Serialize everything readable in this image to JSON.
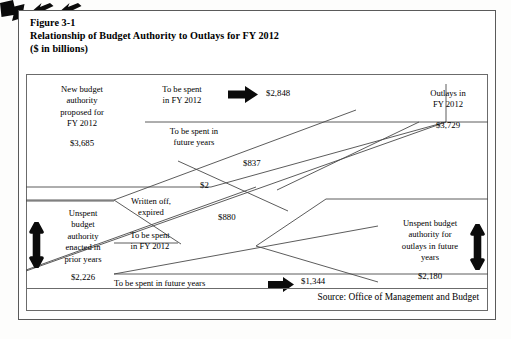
{
  "caption": {
    "line1": "Figure 3-1",
    "line2": "Relationship of Budget Authority to Outlays for FY 2012",
    "line3": "($ in billions)"
  },
  "blocks": {
    "new_authority": {
      "label": "New budget\nauthority\nproposed for\nFY 2012",
      "line1": "New budget",
      "line2": "authority",
      "line3": "proposed for",
      "line4": "FY 2012",
      "amount": "$3,685"
    },
    "outlays_fy2012": {
      "line1": "Outlays in",
      "line2": "FY 2012",
      "amount": "$3,729"
    },
    "unspent_prior": {
      "line1": "Unspent",
      "line2": "budget",
      "line3": "authority",
      "line4": "enacted in",
      "line5": "prior years",
      "amount": "$2,226"
    },
    "unspent_future": {
      "line1": "Unspent budget",
      "line2": "authority for",
      "line3": "outlays in future",
      "line4": "years",
      "amount": "$2,180"
    }
  },
  "flows": [
    {
      "id": "new-to-outlays",
      "line1": "To be spent",
      "line2": "in FY 2012",
      "amount": "$2,848",
      "arrow": "arrow-right-icon"
    },
    {
      "id": "new-to-future",
      "line1": "To be spent in",
      "line2": "future years",
      "amount": "$837",
      "arrow": "arrow-down-right-icon"
    },
    {
      "id": "written-off",
      "line1": "Written off,",
      "line2": "expired",
      "amount": "$2",
      "arrow": "arrow-up-right-icon"
    },
    {
      "id": "prior-to-outlays",
      "line1": "To be spent",
      "line2": "in FY 2012",
      "amount": "$880",
      "arrow": "arrow-up-right-icon"
    },
    {
      "id": "prior-to-future",
      "line1": "To be spent in future years",
      "line2": "",
      "amount": "$1,344",
      "arrow": "arrow-right-icon"
    }
  ],
  "side_arrows": {
    "left": "double-arrow-vertical-icon",
    "right": "double-arrow-vertical-icon"
  },
  "source": "Source:  Office of Management and Budget",
  "colors": {
    "ink": "#000000",
    "rule": "#6b6b6b",
    "frame": "#5a5a5a",
    "page": "#ffffff"
  }
}
